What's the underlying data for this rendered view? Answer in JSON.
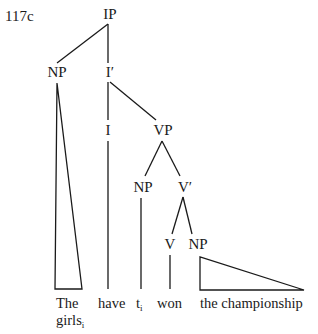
{
  "example_label": "117c",
  "nodes": {
    "ip": "IP",
    "np_subject": "NP",
    "i_bar": "I′",
    "i": "I",
    "vp": "VP",
    "np_trace": "NP",
    "v_bar": "V′",
    "v": "V",
    "np_object": "NP"
  },
  "leaves": {
    "subject_line1": "The",
    "subject_line2": "girls",
    "subject_index": "i",
    "aux": "have",
    "trace": "t",
    "trace_index": "i",
    "verb": "won",
    "object": "the championship"
  }
}
